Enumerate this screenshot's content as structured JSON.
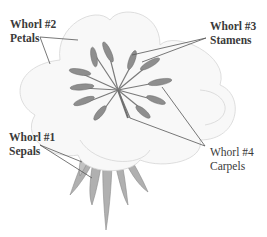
{
  "diagram": {
    "labels": [
      {
        "id": "whorl2",
        "title": "Whorl #2",
        "part": "Petals"
      },
      {
        "id": "whorl3",
        "title": "Whorl #3",
        "part": "Stamens"
      },
      {
        "id": "whorl1",
        "title": "Whorl #1",
        "part": "Sepals"
      },
      {
        "id": "whorl4",
        "title": "Whorl #4",
        "part": "Carpels"
      }
    ],
    "colors": {
      "petal_fill": "#f7f7f7",
      "petal_stroke": "#d8d8d8",
      "stamen": "#8a8a8a",
      "sepal": "#a8a8a8",
      "leader_line": "#555555",
      "text": "#3a3a3a"
    }
  }
}
